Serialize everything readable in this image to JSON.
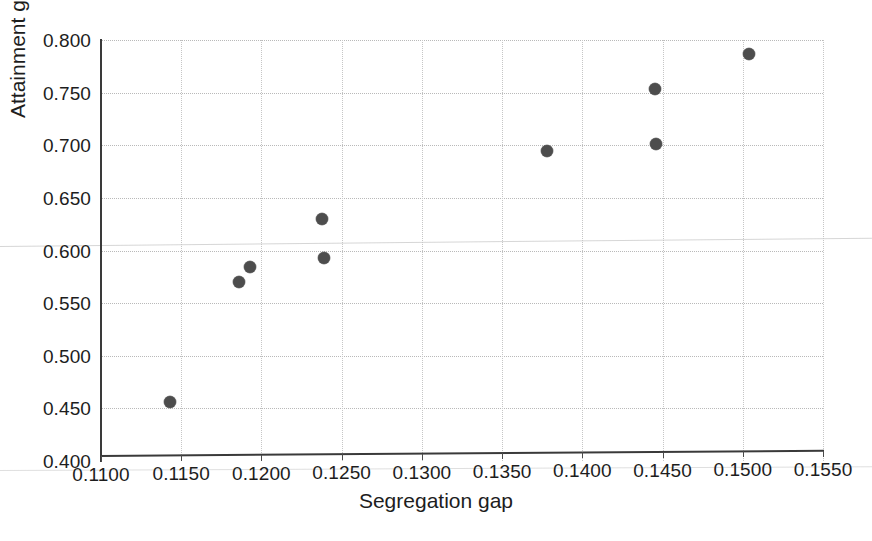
{
  "chart_data": {
    "type": "scatter",
    "title": "",
    "xlabel": "Segregation gap",
    "ylabel": "Attainment gap",
    "xlim": [
      0.11,
      0.155
    ],
    "ylim": [
      0.4,
      0.8
    ],
    "xticks": [
      "0.1100",
      "0.1150",
      "0.1200",
      "0.1250",
      "0.1300",
      "0.1350",
      "0.1400",
      "0.1450",
      "0.1500",
      "0.1550"
    ],
    "xtick_values": [
      0.11,
      0.115,
      0.12,
      0.125,
      0.13,
      0.135,
      0.14,
      0.145,
      0.15,
      0.155
    ],
    "yticks": [
      "0.400",
      "0.450",
      "0.500",
      "0.550",
      "0.600",
      "0.650",
      "0.700",
      "0.750",
      "0.800"
    ],
    "ytick_values": [
      0.4,
      0.45,
      0.5,
      0.55,
      0.6,
      0.65,
      0.7,
      0.75,
      0.8
    ],
    "grid": true,
    "grid_style": "dotted",
    "legend": false,
    "marker_color": "#4d4d4d",
    "marker_shape": "circle",
    "marker_size": 12,
    "points": [
      {
        "x": 0.1143,
        "y": 0.456
      },
      {
        "x": 0.1186,
        "y": 0.57
      },
      {
        "x": 0.1193,
        "y": 0.584
      },
      {
        "x": 0.1238,
        "y": 0.63
      },
      {
        "x": 0.1239,
        "y": 0.593
      },
      {
        "x": 0.1378,
        "y": 0.695
      },
      {
        "x": 0.1445,
        "y": 0.753
      },
      {
        "x": 0.1446,
        "y": 0.701
      },
      {
        "x": 0.1504,
        "y": 0.787
      }
    ],
    "series": [
      {
        "name": "observations",
        "x": [
          0.1143,
          0.1186,
          0.1193,
          0.1238,
          0.1239,
          0.1378,
          0.1445,
          0.1446,
          0.1504
        ],
        "values": [
          0.456,
          0.57,
          0.584,
          0.63,
          0.593,
          0.695,
          0.753,
          0.701,
          0.787
        ]
      }
    ]
  },
  "colors": {
    "marker": "#4d4d4d",
    "axis": "#3a3a3a",
    "grid": "#b9b9b9",
    "text": "#1d1d1d",
    "background": "#ffffff"
  }
}
